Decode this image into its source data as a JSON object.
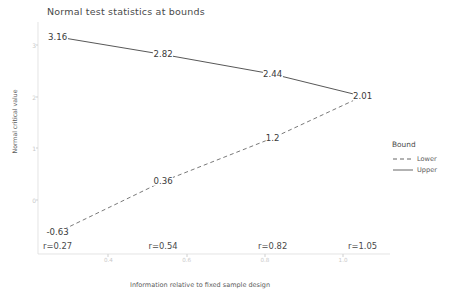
{
  "chart_data": {
    "type": "line",
    "title": "Normal test statistics at bounds",
    "xlabel": "Information relative to fixed sample design",
    "ylabel": "Normal critical value",
    "x": [
      0.27,
      0.54,
      0.82,
      1.05
    ],
    "xlim": [
      0.22,
      1.12
    ],
    "ylim": [
      -1.05,
      3.45
    ],
    "xticks": [
      "0.4",
      "0.6",
      "0.8",
      "1.0"
    ],
    "xtick_values": [
      0.4,
      0.6,
      0.8,
      1.0
    ],
    "yticks": [
      "0",
      "1",
      "2",
      "3"
    ],
    "ytick_values": [
      0,
      1,
      2,
      3
    ],
    "grid": false,
    "legend_title": "Bound",
    "legend_position": "right",
    "point_labels": [
      "r=0.27",
      "r=0.54",
      "r=0.82",
      "r=1.05"
    ],
    "series": [
      {
        "name": "Upper",
        "style": "solid",
        "color": "#444444",
        "values": [
          3.16,
          2.82,
          2.44,
          2.01
        ],
        "labels": [
          "3.16",
          "2.82",
          "2.44",
          "2.01"
        ]
      },
      {
        "name": "Lower",
        "style": "dashed",
        "color": "#6a6a6a",
        "values": [
          -0.63,
          0.36,
          1.2,
          2.01
        ],
        "labels": [
          "-0.63",
          "0.36",
          "1.2",
          "2.01"
        ]
      }
    ]
  },
  "legend": {
    "title": "Bound",
    "entries": [
      {
        "label": "Lower",
        "style": "dashed"
      },
      {
        "label": "Upper",
        "style": "solid"
      }
    ]
  }
}
